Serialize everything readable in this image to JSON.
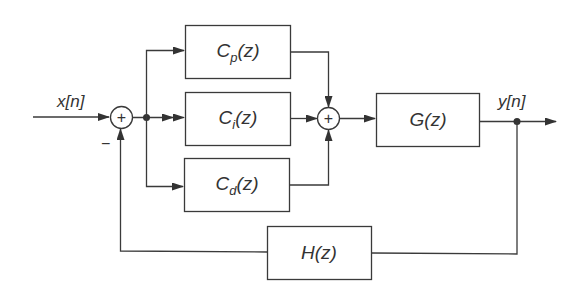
{
  "diagram": {
    "type": "block-diagram",
    "input_label": "x[n]",
    "output_label": "y[n]",
    "feedback_sign": "−",
    "summer_symbol": "+",
    "blocks": {
      "cp": {
        "name": "C",
        "sub": "p",
        "arg": "(z)"
      },
      "ci": {
        "name": "C",
        "sub": "i",
        "arg": "(z)"
      },
      "cd": {
        "name": "C",
        "sub": "d",
        "arg": "(z)"
      },
      "g": {
        "label": "G(z)"
      },
      "h": {
        "label": "H(z)"
      }
    },
    "colors": {
      "stroke": "#3a3a3a",
      "text": "#333333",
      "background": "#ffffff"
    }
  }
}
